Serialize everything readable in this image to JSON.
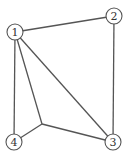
{
  "graph": {
    "nodes": [
      {
        "id": "1",
        "label": "1",
        "x": 15,
        "y": 32
      },
      {
        "id": "2",
        "label": "2",
        "x": 114,
        "y": 16
      },
      {
        "id": "3",
        "label": "3",
        "x": 113,
        "y": 142
      },
      {
        "id": "4",
        "label": "4",
        "x": 14,
        "y": 142
      }
    ],
    "junction": {
      "x": 42,
      "y": 124
    },
    "edges": [
      [
        "1",
        "2"
      ],
      [
        "2",
        "3"
      ],
      [
        "1",
        "3"
      ],
      [
        "1",
        "4"
      ],
      [
        "1",
        "junction"
      ],
      [
        "4",
        "junction"
      ],
      [
        "junction",
        "3"
      ]
    ],
    "colors": {
      "stroke": "#555555",
      "text": "#333333",
      "background": "#ffffff"
    }
  }
}
